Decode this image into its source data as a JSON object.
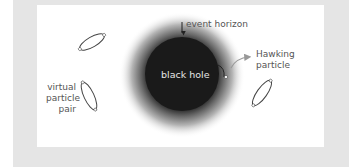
{
  "diagram": {
    "labels": {
      "event_horizon": "event horizon",
      "black_hole": "black hole",
      "hawking_particle_line1": "Hawking",
      "hawking_particle_line2": "particle",
      "virtual_pair_line1": "virtual",
      "virtual_pair_line2": "particle",
      "virtual_pair_line3": "pair"
    },
    "colors": {
      "frame": "#e5e5e5",
      "panel": "#ffffff",
      "black_hole": "#1a1a1a",
      "label_text": "#555555",
      "arrow": "#999999"
    }
  }
}
